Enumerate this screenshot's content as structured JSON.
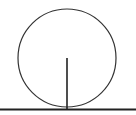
{
  "diagram": {
    "stroke_color": "#333333",
    "baseline_color": "#222222",
    "circle": {
      "cx": 67,
      "cy": 58,
      "r": 49
    },
    "radius_segment": {
      "x1": 67,
      "y1": 58,
      "x2": 67,
      "y2": 109
    },
    "tangent_line": {
      "x1": 0,
      "y1": 109.5,
      "x2": 136,
      "y2": 109.5
    }
  }
}
